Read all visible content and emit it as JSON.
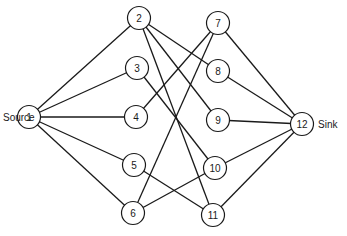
{
  "diagram": {
    "type": "network-flow-graph",
    "labels": {
      "source": {
        "text": "Source",
        "node": "1"
      },
      "sink": {
        "text": "Sink",
        "node": "12"
      }
    },
    "nodes": [
      {
        "id": "1",
        "label": "1",
        "x": 29,
        "y": 117
      },
      {
        "id": "2",
        "label": "2",
        "x": 139,
        "y": 18
      },
      {
        "id": "3",
        "label": "3",
        "x": 137,
        "y": 68
      },
      {
        "id": "4",
        "label": "4",
        "x": 136,
        "y": 117
      },
      {
        "id": "5",
        "label": "5",
        "x": 134,
        "y": 165
      },
      {
        "id": "6",
        "label": "6",
        "x": 133,
        "y": 213
      },
      {
        "id": "7",
        "label": "7",
        "x": 218,
        "y": 23
      },
      {
        "id": "8",
        "label": "8",
        "x": 218,
        "y": 71
      },
      {
        "id": "9",
        "label": "9",
        "x": 218,
        "y": 120
      },
      {
        "id": "10",
        "label": "10",
        "x": 215,
        "y": 168
      },
      {
        "id": "11",
        "label": "11",
        "x": 213,
        "y": 215
      },
      {
        "id": "12",
        "label": "12",
        "x": 302,
        "y": 124
      }
    ],
    "edges": [
      [
        "1",
        "2"
      ],
      [
        "1",
        "3"
      ],
      [
        "1",
        "4"
      ],
      [
        "1",
        "5"
      ],
      [
        "1",
        "6"
      ],
      [
        "2",
        "8"
      ],
      [
        "2",
        "9"
      ],
      [
        "2",
        "11"
      ],
      [
        "3",
        "10"
      ],
      [
        "4",
        "7"
      ],
      [
        "5",
        "11"
      ],
      [
        "6",
        "7"
      ],
      [
        "6",
        "10"
      ],
      [
        "7",
        "12"
      ],
      [
        "8",
        "12"
      ],
      [
        "9",
        "12"
      ],
      [
        "10",
        "12"
      ],
      [
        "11",
        "12"
      ]
    ]
  }
}
